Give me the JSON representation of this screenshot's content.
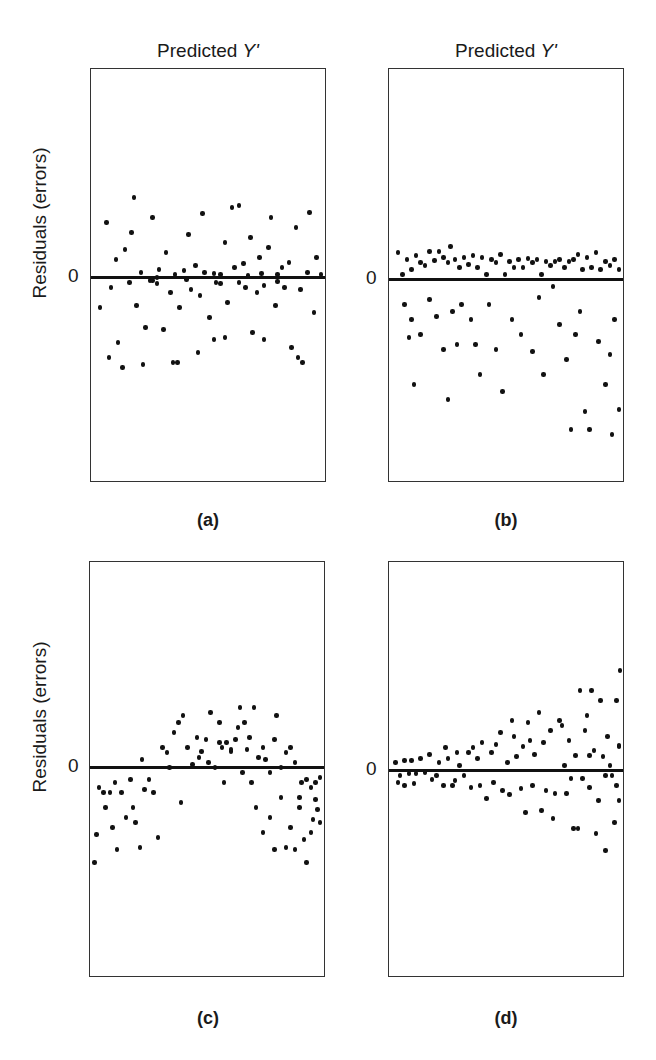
{
  "chart_data": [
    {
      "id": "a",
      "type": "scatter",
      "title": "(a)",
      "xlabel": "Predicted Y'",
      "ylabel": "Residuals (errors)",
      "yticks": [
        "0"
      ],
      "description": "Homoscedastic, random band around zero",
      "box": {
        "left": 90,
        "top": 68,
        "width": 236,
        "height": 414
      },
      "zero_y": 276,
      "zero_slope": -0.015,
      "points": [
        [
          0.02,
          -30
        ],
        [
          0.05,
          55
        ],
        [
          0.07,
          -10
        ],
        [
          0.09,
          18
        ],
        [
          0.1,
          -65
        ],
        [
          0.12,
          -90
        ],
        [
          0.13,
          28
        ],
        [
          0.15,
          -5
        ],
        [
          0.16,
          45
        ],
        [
          0.17,
          80
        ],
        [
          0.18,
          -28
        ],
        [
          0.2,
          5
        ],
        [
          0.22,
          -50
        ],
        [
          0.24,
          -3
        ],
        [
          0.25,
          60
        ],
        [
          0.27,
          0
        ],
        [
          0.28,
          8
        ],
        [
          0.3,
          -52
        ],
        [
          0.31,
          25
        ],
        [
          0.33,
          -15
        ],
        [
          0.35,
          3
        ],
        [
          0.36,
          -85
        ],
        [
          0.37,
          -30
        ],
        [
          0.39,
          7
        ],
        [
          0.41,
          43
        ],
        [
          0.42,
          -12
        ],
        [
          0.44,
          12
        ],
        [
          0.46,
          -18
        ],
        [
          0.47,
          64
        ],
        [
          0.48,
          5
        ],
        [
          0.5,
          -40
        ],
        [
          0.52,
          -62
        ],
        [
          0.53,
          -5
        ],
        [
          0.55,
          3
        ],
        [
          0.57,
          35
        ],
        [
          0.58,
          -25
        ],
        [
          0.6,
          70
        ],
        [
          0.61,
          10
        ],
        [
          0.63,
          -5
        ],
        [
          0.65,
          14
        ],
        [
          0.66,
          -10
        ],
        [
          0.68,
          40
        ],
        [
          0.69,
          -55
        ],
        [
          0.71,
          -15
        ],
        [
          0.72,
          20
        ],
        [
          0.74,
          -8
        ],
        [
          0.76,
          30
        ],
        [
          0.77,
          60
        ],
        [
          0.79,
          -28
        ],
        [
          0.8,
          3
        ],
        [
          0.82,
          10
        ],
        [
          0.83,
          -10
        ],
        [
          0.85,
          15
        ],
        [
          0.86,
          -70
        ],
        [
          0.88,
          50
        ],
        [
          0.9,
          -12
        ],
        [
          0.91,
          -85
        ],
        [
          0.93,
          5
        ],
        [
          0.94,
          65
        ],
        [
          0.96,
          -35
        ],
        [
          0.97,
          20
        ],
        [
          0.99,
          3
        ],
        [
          0.06,
          -80
        ],
        [
          0.21,
          -87
        ],
        [
          0.34,
          -85
        ],
        [
          0.57,
          -60
        ],
        [
          0.74,
          -62
        ],
        [
          0.89,
          -80
        ],
        [
          0.45,
          -75
        ],
        [
          0.63,
          72
        ],
        [
          0.25,
          -3
        ],
        [
          0.27,
          -6
        ],
        [
          0.4,
          -2
        ],
        [
          0.52,
          4
        ],
        [
          0.55,
          -6
        ],
        [
          0.67,
          2
        ],
        [
          0.8,
          -4
        ],
        [
          0.73,
          4
        ]
      ]
    },
    {
      "id": "b",
      "type": "scatter",
      "title": "(b)",
      "xlabel": "Predicted Y'",
      "ylabel": "",
      "yticks": [
        "0"
      ],
      "description": "Skewed residuals: tight cluster above zero, spread far below",
      "box": {
        "left": 388,
        "top": 68,
        "width": 236,
        "height": 414
      },
      "zero_y": 278,
      "zero_slope": 0,
      "points": [
        [
          0.02,
          27
        ],
        [
          0.04,
          5
        ],
        [
          0.06,
          20
        ],
        [
          0.08,
          10
        ],
        [
          0.1,
          24
        ],
        [
          0.12,
          17
        ],
        [
          0.14,
          14
        ],
        [
          0.16,
          28
        ],
        [
          0.18,
          19
        ],
        [
          0.2,
          28
        ],
        [
          0.22,
          22
        ],
        [
          0.24,
          17
        ],
        [
          0.25,
          33
        ],
        [
          0.27,
          20
        ],
        [
          0.29,
          12
        ],
        [
          0.31,
          22
        ],
        [
          0.33,
          15
        ],
        [
          0.35,
          24
        ],
        [
          0.37,
          12
        ],
        [
          0.39,
          22
        ],
        [
          0.41,
          5
        ],
        [
          0.43,
          20
        ],
        [
          0.45,
          17
        ],
        [
          0.47,
          25
        ],
        [
          0.49,
          5
        ],
        [
          0.51,
          18
        ],
        [
          0.53,
          12
        ],
        [
          0.55,
          20
        ],
        [
          0.57,
          12
        ],
        [
          0.59,
          21
        ],
        [
          0.61,
          17
        ],
        [
          0.63,
          20
        ],
        [
          0.65,
          5
        ],
        [
          0.67,
          18
        ],
        [
          0.69,
          14
        ],
        [
          0.71,
          18
        ],
        [
          0.73,
          20
        ],
        [
          0.75,
          12
        ],
        [
          0.77,
          18
        ],
        [
          0.79,
          20
        ],
        [
          0.81,
          25
        ],
        [
          0.83,
          10
        ],
        [
          0.85,
          22
        ],
        [
          0.87,
          12
        ],
        [
          0.89,
          27
        ],
        [
          0.91,
          10
        ],
        [
          0.93,
          18
        ],
        [
          0.95,
          14
        ],
        [
          0.97,
          20
        ],
        [
          0.99,
          10
        ],
        [
          0.05,
          -25
        ],
        [
          0.08,
          -40
        ],
        [
          0.12,
          -55
        ],
        [
          0.07,
          -58
        ],
        [
          0.09,
          -105
        ],
        [
          0.16,
          -20
        ],
        [
          0.19,
          -37
        ],
        [
          0.22,
          -70
        ],
        [
          0.24,
          -120
        ],
        [
          0.26,
          -32
        ],
        [
          0.28,
          -65
        ],
        [
          0.3,
          -25
        ],
        [
          0.34,
          -40
        ],
        [
          0.36,
          -65
        ],
        [
          0.38,
          -95
        ],
        [
          0.42,
          -25
        ],
        [
          0.45,
          -70
        ],
        [
          0.48,
          -112
        ],
        [
          0.52,
          -40
        ],
        [
          0.56,
          -55
        ],
        [
          0.61,
          -72
        ],
        [
          0.64,
          -18
        ],
        [
          0.66,
          -95
        ],
        [
          0.7,
          -7
        ],
        [
          0.73,
          -45
        ],
        [
          0.76,
          -80
        ],
        [
          0.78,
          -150
        ],
        [
          0.8,
          -55
        ],
        [
          0.82,
          -32
        ],
        [
          0.84,
          -132
        ],
        [
          0.86,
          -150
        ],
        [
          0.9,
          -62
        ],
        [
          0.93,
          -105
        ],
        [
          0.95,
          -75
        ],
        [
          0.97,
          -40
        ],
        [
          0.99,
          -130
        ],
        [
          0.96,
          -155
        ]
      ]
    },
    {
      "id": "c",
      "type": "scatter",
      "title": "(c)",
      "xlabel": "",
      "ylabel": "Residuals (errors)",
      "yticks": [
        "0"
      ],
      "description": "Curvilinear (inverted U) pattern",
      "box": {
        "left": 89,
        "top": 561,
        "width": 236,
        "height": 416
      },
      "zero_y": 766,
      "zero_slope": 0,
      "points": [
        [
          0.0,
          -95
        ],
        [
          0.01,
          -67
        ],
        [
          0.02,
          -20
        ],
        [
          0.04,
          -25
        ],
        [
          0.05,
          -40
        ],
        [
          0.07,
          -25
        ],
        [
          0.08,
          -60
        ],
        [
          0.09,
          -15
        ],
        [
          0.1,
          -82
        ],
        [
          0.12,
          -25
        ],
        [
          0.14,
          -50
        ],
        [
          0.16,
          -12
        ],
        [
          0.17,
          -40
        ],
        [
          0.18,
          -55
        ],
        [
          0.2,
          -80
        ],
        [
          0.21,
          8
        ],
        [
          0.22,
          -22
        ],
        [
          0.24,
          -12
        ],
        [
          0.26,
          -25
        ],
        [
          0.28,
          -70
        ],
        [
          0.3,
          20
        ],
        [
          0.32,
          15
        ],
        [
          0.33,
          0
        ],
        [
          0.35,
          35
        ],
        [
          0.37,
          45
        ],
        [
          0.38,
          -35
        ],
        [
          0.39,
          52
        ],
        [
          0.41,
          20
        ],
        [
          0.43,
          3
        ],
        [
          0.45,
          30
        ],
        [
          0.47,
          16
        ],
        [
          0.49,
          28
        ],
        [
          0.51,
          55
        ],
        [
          0.53,
          0
        ],
        [
          0.55,
          45
        ],
        [
          0.56,
          20
        ],
        [
          0.57,
          -15
        ],
        [
          0.6,
          16
        ],
        [
          0.62,
          28
        ],
        [
          0.64,
          60
        ],
        [
          0.65,
          -5
        ],
        [
          0.67,
          18
        ],
        [
          0.69,
          -15
        ],
        [
          0.7,
          60
        ],
        [
          0.72,
          10
        ],
        [
          0.74,
          20
        ],
        [
          0.75,
          8
        ],
        [
          0.77,
          -5
        ],
        [
          0.79,
          28
        ],
        [
          0.8,
          52
        ],
        [
          0.82,
          0
        ],
        [
          0.84,
          15
        ],
        [
          0.86,
          20
        ],
        [
          0.88,
          5
        ],
        [
          0.9,
          -40
        ],
        [
          0.91,
          -15
        ],
        [
          0.92,
          -72
        ],
        [
          0.93,
          -12
        ],
        [
          0.95,
          -20
        ],
        [
          0.96,
          -52
        ],
        [
          0.97,
          -32
        ],
        [
          0.98,
          -42
        ],
        [
          0.99,
          -55
        ],
        [
          0.71,
          -40
        ],
        [
          0.74,
          -65
        ],
        [
          0.77,
          -50
        ],
        [
          0.79,
          -82
        ],
        [
          0.82,
          -30
        ],
        [
          0.84,
          -80
        ],
        [
          0.86,
          -60
        ],
        [
          0.88,
          -82
        ],
        [
          0.9,
          -30
        ],
        [
          0.93,
          -95
        ],
        [
          0.95,
          -65
        ],
        [
          0.97,
          -15
        ],
        [
          0.99,
          -10
        ],
        [
          0.55,
          25
        ],
        [
          0.58,
          25
        ],
        [
          0.6,
          18
        ],
        [
          0.46,
          10
        ],
        [
          0.5,
          5
        ],
        [
          0.63,
          40
        ],
        [
          0.66,
          45
        ],
        [
          0.68,
          30
        ]
      ]
    },
    {
      "id": "d",
      "type": "scatter",
      "title": "(d)",
      "xlabel": "",
      "ylabel": "",
      "yticks": [
        "0"
      ],
      "description": "Heteroscedastic: spread increases with predicted Y' (funnel)",
      "box": {
        "left": 388,
        "top": 561,
        "width": 236,
        "height": 416
      },
      "zero_y": 769,
      "zero_slope": 0,
      "points": [
        [
          0.01,
          8
        ],
        [
          0.02,
          -12
        ],
        [
          0.03,
          -5
        ],
        [
          0.05,
          10
        ],
        [
          0.05,
          -15
        ],
        [
          0.07,
          -3
        ],
        [
          0.08,
          10
        ],
        [
          0.09,
          -13
        ],
        [
          0.1,
          -3
        ],
        [
          0.12,
          12
        ],
        [
          0.14,
          -2
        ],
        [
          0.16,
          16
        ],
        [
          0.17,
          -9
        ],
        [
          0.19,
          -5
        ],
        [
          0.2,
          8
        ],
        [
          0.22,
          -15
        ],
        [
          0.23,
          23
        ],
        [
          0.24,
          12
        ],
        [
          0.26,
          -15
        ],
        [
          0.27,
          -10
        ],
        [
          0.28,
          18
        ],
        [
          0.29,
          5
        ],
        [
          0.31,
          -5
        ],
        [
          0.33,
          18
        ],
        [
          0.34,
          -17
        ],
        [
          0.35,
          23
        ],
        [
          0.37,
          12
        ],
        [
          0.38,
          -15
        ],
        [
          0.39,
          28
        ],
        [
          0.41,
          -28
        ],
        [
          0.43,
          18
        ],
        [
          0.44,
          -12
        ],
        [
          0.45,
          26
        ],
        [
          0.47,
          38
        ],
        [
          0.48,
          -20
        ],
        [
          0.5,
          8
        ],
        [
          0.51,
          -24
        ],
        [
          0.52,
          50
        ],
        [
          0.53,
          34
        ],
        [
          0.54,
          14
        ],
        [
          0.56,
          -18
        ],
        [
          0.57,
          24
        ],
        [
          0.58,
          -42
        ],
        [
          0.59,
          48
        ],
        [
          0.6,
          30
        ],
        [
          0.61,
          -15
        ],
        [
          0.62,
          16
        ],
        [
          0.64,
          58
        ],
        [
          0.65,
          -40
        ],
        [
          0.66,
          28
        ],
        [
          0.67,
          -20
        ],
        [
          0.69,
          40
        ],
        [
          0.7,
          -48
        ],
        [
          0.71,
          -23
        ],
        [
          0.73,
          50
        ],
        [
          0.74,
          45
        ],
        [
          0.75,
          5
        ],
        [
          0.76,
          -23
        ],
        [
          0.77,
          30
        ],
        [
          0.78,
          -8
        ],
        [
          0.79,
          -58
        ],
        [
          0.8,
          15
        ],
        [
          0.81,
          -58
        ],
        [
          0.82,
          80
        ],
        [
          0.83,
          -8
        ],
        [
          0.84,
          40
        ],
        [
          0.85,
          55
        ],
        [
          0.86,
          -17
        ],
        [
          0.87,
          80
        ],
        [
          0.88,
          20
        ],
        [
          0.89,
          -63
        ],
        [
          0.9,
          -30
        ],
        [
          0.91,
          70
        ],
        [
          0.92,
          14
        ],
        [
          0.93,
          -80
        ],
        [
          0.94,
          34
        ],
        [
          0.95,
          5
        ],
        [
          0.96,
          -5
        ],
        [
          0.97,
          -52
        ],
        [
          0.98,
          70
        ],
        [
          0.98,
          -15
        ],
        [
          0.99,
          24
        ],
        [
          0.99,
          -30
        ],
        [
          0.995,
          100
        ],
        [
          0.99,
          25
        ],
        [
          0.93,
          -5
        ],
        [
          0.86,
          15
        ]
      ]
    }
  ],
  "labels": {
    "top_prefix": "Predicted ",
    "top_var": "Y'",
    "ylabel": "Residuals (errors)",
    "zero": "0",
    "panel_a": "(a)",
    "panel_b": "(b)",
    "panel_c": "(c)",
    "panel_d": "(d)"
  }
}
